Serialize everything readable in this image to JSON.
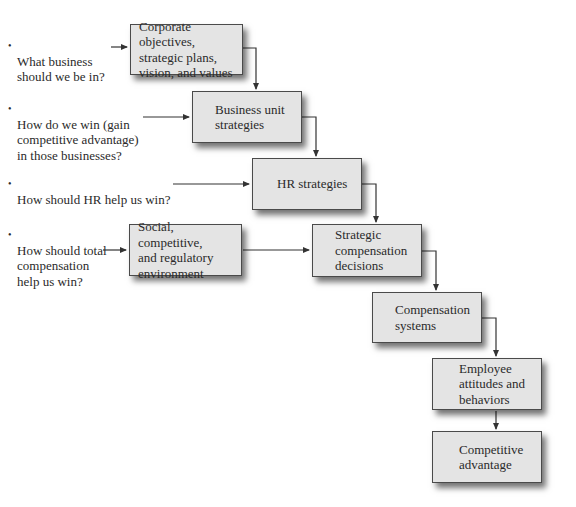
{
  "questions": [
    {
      "text": "What business\nshould we be in?"
    },
    {
      "text": "How do we win (gain\ncompetitive advantage)\nin those businesses?"
    },
    {
      "text": "How should HR help us win?"
    },
    {
      "text": "How should total\ncompensation\nhelp us win?"
    }
  ],
  "boxes": [
    {
      "label": "Corporate objectives,\nstrategic plans,\nvision, and values"
    },
    {
      "label": "Business unit\nstrategies"
    },
    {
      "label": "HR strategies"
    },
    {
      "label": "Social, competitive,\nand regulatory\nenvironment"
    },
    {
      "label": "Strategic\ncompensation\ndecisions"
    },
    {
      "label": "Compensation\nsystems"
    },
    {
      "label": "Employee\nattitudes and\nbehaviors"
    },
    {
      "label": "Competitive\nadvantage"
    }
  ],
  "colors": {
    "box_fill": "#e4e4e4",
    "box_border": "#4a4a4a",
    "line": "#333333"
  }
}
